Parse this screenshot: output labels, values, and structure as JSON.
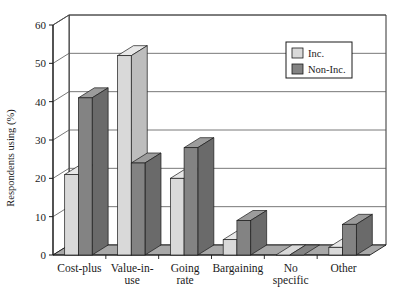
{
  "chart_data": {
    "type": "bar",
    "title": "",
    "xlabel": "",
    "ylabel": "Respondents using (%)",
    "ylim": [
      0,
      60
    ],
    "ytick_step": 10,
    "yticks": [
      "0",
      "10",
      "20",
      "30",
      "40",
      "50",
      "60"
    ],
    "grid": true,
    "style": "3d-grouped-bar",
    "legend_position": "top-right",
    "categories": [
      "Cost-plus",
      "Value-in-use",
      "Going rate",
      "Bargaining",
      "No specific",
      "Other"
    ],
    "category_lines": [
      [
        "Cost-plus"
      ],
      [
        "Value-in-",
        "use"
      ],
      [
        "Going",
        "rate"
      ],
      [
        "Bargaining"
      ],
      [
        "No",
        "specific"
      ],
      [
        "Other"
      ]
    ],
    "series": [
      {
        "name": "Inc.",
        "color": "#d9d9d9",
        "side_color": "#bdbdbd",
        "top_color": "#e8e8e8",
        "values": [
          21,
          52,
          20,
          4,
          0,
          2
        ]
      },
      {
        "name": "Non-Inc.",
        "color": "#838383",
        "side_color": "#6a6a6a",
        "top_color": "#9c9c9c",
        "values": [
          41,
          24,
          28,
          9,
          0,
          8
        ]
      }
    ]
  },
  "legend": {
    "items": [
      {
        "label": "Inc."
      },
      {
        "label": "Non-Inc."
      }
    ]
  },
  "colors": {
    "background": "#ffffff",
    "axis": "#1a1a1a",
    "grid": "#555555",
    "floor": "#a8a8a8",
    "wall": "#ffffff",
    "inc": "#d9d9d9",
    "non_inc": "#838383"
  }
}
